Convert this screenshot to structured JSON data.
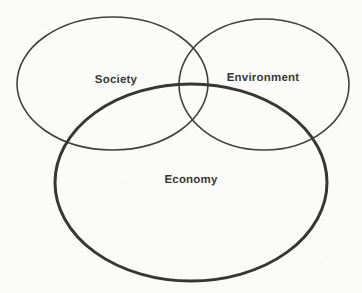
{
  "figure": {
    "type": "venn-diagram",
    "background_color": "#fbfbf9",
    "label_color": "#1a1a18",
    "stroke_color": "#1f1f1f"
  },
  "circles": [
    {
      "id": "society",
      "label": "Society",
      "position": "top-left",
      "stroke_width": 1.6,
      "stroke_color": "#262626",
      "fill": "none",
      "cx": 112.5,
      "cy": 83.5,
      "rx": 95.5,
      "ry": 66.5
    },
    {
      "id": "environment",
      "label": "Environment",
      "position": "top-right",
      "stroke_width": 1.6,
      "stroke_color": "#262626",
      "fill": "none",
      "cx": 264.0,
      "cy": 84.5,
      "rx": 85.0,
      "ry": 65.5
    },
    {
      "id": "economy",
      "label": "Economy",
      "position": "bottom-center",
      "stroke_width": 3.0,
      "stroke_color": "#1b1b1b",
      "fill": "none",
      "cx": 191.0,
      "cy": 182.5,
      "rx": 136.0,
      "ry": 98.5
    }
  ],
  "labels": [
    {
      "id": "society-label",
      "text": "Society",
      "x": 116,
      "y": 81,
      "font_size": 11.5,
      "bold": true
    },
    {
      "id": "environment-label",
      "text": "Environment",
      "x": 263,
      "y": 79,
      "font_size": 11.5,
      "bold": true
    },
    {
      "id": "economy-label",
      "text": "Economy",
      "x": 191,
      "y": 181,
      "font_size": 11.5,
      "bold": true
    }
  ],
  "chart_data": {
    "type": "venn",
    "sets": [
      "Society",
      "Environment",
      "Economy"
    ],
    "overlaps": [
      [
        "Society",
        "Environment"
      ],
      [
        "Society",
        "Economy"
      ],
      [
        "Environment",
        "Economy"
      ],
      [
        "Society",
        "Environment",
        "Economy"
      ]
    ],
    "legend": "none",
    "grid": false
  }
}
